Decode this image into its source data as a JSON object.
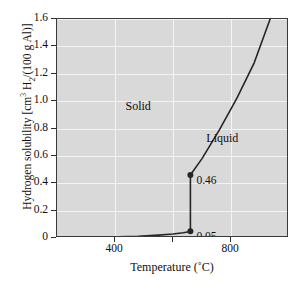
{
  "chart_data": {
    "type": "line",
    "title": "",
    "xlabel": "Temperature (˚C)",
    "ylabel": "Hydrogen solubility [cm³ H₂/(100 g Al)]",
    "ylabel_parts": {
      "prefix": "Hydrogen solubility [cm",
      "sup1": "3",
      "mid": " H",
      "sub1": "2",
      "suffix": "/(100 g Al)]"
    },
    "xlabel_parts": {
      "prefix": "Temperature (",
      "degree": "˚",
      "suffix": "C)"
    },
    "xlim": [
      200,
      1000
    ],
    "ylim": [
      0,
      1.6
    ],
    "grid": true,
    "legend": "none",
    "xticks": [
      200,
      400,
      600,
      800,
      1000
    ],
    "xtick_labels": [
      "",
      "400",
      "",
      "800",
      ""
    ],
    "yticks": [
      0,
      0.2,
      0.4,
      0.6,
      0.8,
      1.0,
      1.2,
      1.4,
      1.6
    ],
    "ytick_labels": [
      "0",
      "0.2",
      "0.4",
      "0.6",
      "0.8",
      "1.0",
      "1.2",
      "1.4",
      "1.6"
    ],
    "series": [
      {
        "name": "Solid solubility",
        "points": [
          [
            200,
            0.002
          ],
          [
            300,
            0.004
          ],
          [
            400,
            0.008
          ],
          [
            480,
            0.013
          ],
          [
            550,
            0.021
          ],
          [
            600,
            0.029
          ],
          [
            635,
            0.038
          ],
          [
            655,
            0.046
          ],
          [
            660,
            0.05
          ]
        ]
      },
      {
        "name": "Melting discontinuity",
        "points": [
          [
            660,
            0.05
          ],
          [
            660,
            0.46
          ]
        ]
      },
      {
        "name": "Liquid solubility",
        "points": [
          [
            660,
            0.46
          ],
          [
            700,
            0.58
          ],
          [
            760,
            0.79
          ],
          [
            820,
            1.02
          ],
          [
            880,
            1.28
          ],
          [
            935,
            1.6
          ]
        ]
      }
    ],
    "markers": [
      {
        "x": 660,
        "y": 0.46,
        "label": "0.46"
      },
      {
        "x": 660,
        "y": 0.05,
        "label": "0.05"
      }
    ],
    "annotations": [
      {
        "text": "Solid",
        "x": 480,
        "y": 0.96
      },
      {
        "text": "Liquid",
        "x": 770,
        "y": 0.72
      }
    ],
    "colors": {
      "plot_background": "#d9d9d9",
      "gridline": "#f4f4f4",
      "curve": "#262626",
      "axis": "#3a3a3a",
      "text": "#0f0f0f"
    }
  }
}
